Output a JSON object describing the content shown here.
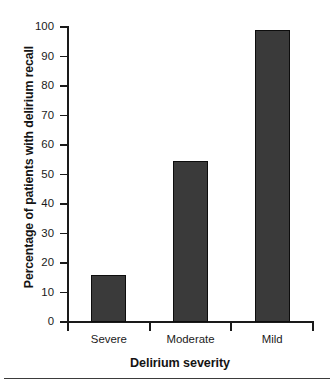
{
  "chart_data": {
    "type": "bar",
    "title": "",
    "categories": [
      "Severe",
      "Moderate",
      "Mild"
    ],
    "values": [
      16,
      54.5,
      99
    ],
    "xlabel": "Delirium severity",
    "ylabel": "Percentage of patients with delirium recall",
    "ylim": [
      0,
      100
    ],
    "yticks": [
      0,
      10,
      20,
      30,
      40,
      50,
      60,
      70,
      80,
      90,
      100
    ],
    "ytick_labels": [
      "0",
      "10",
      "20",
      "30",
      "40",
      "50",
      "60",
      "70",
      "80",
      "90",
      "100"
    ],
    "grid": false,
    "legend": false,
    "bar_color": "#3a3a3a",
    "bar_edge_color": "#0d0d0d",
    "axis_color": "#1a1a1a",
    "background": "#ffffff"
  }
}
